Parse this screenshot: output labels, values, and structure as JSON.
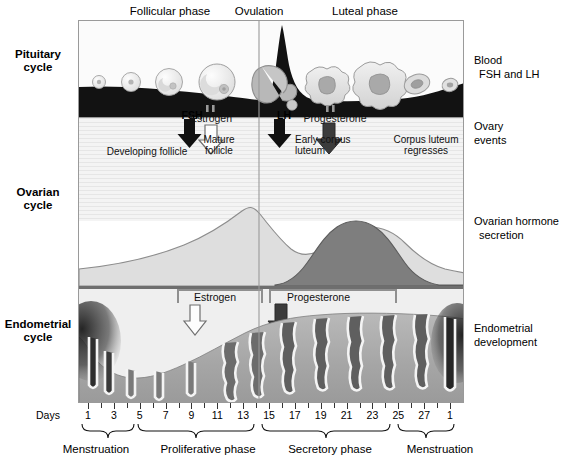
{
  "diagram": {
    "top_phases": [
      {
        "key": "follicular",
        "label": "Follicular phase"
      },
      {
        "key": "ovulation",
        "label": "Ovulation"
      },
      {
        "key": "luteal",
        "label": "Luteal phase"
      }
    ],
    "row_labels": [
      {
        "key": "pituitary",
        "line1": "Pituitary",
        "line2": "cycle"
      },
      {
        "key": "ovarian",
        "line1": "Ovarian",
        "line2": "cycle"
      },
      {
        "key": "endometrial",
        "line1": "Endometrial",
        "line2": "cycle"
      }
    ],
    "right_labels": [
      {
        "key": "blood",
        "line1": "Blood",
        "line2": "FSH and LH"
      },
      {
        "key": "ovary",
        "line1": "Ovary",
        "line2": "events"
      },
      {
        "key": "hormone",
        "line1": "Ovarian hormone",
        "line2": "secretion"
      },
      {
        "key": "endodev",
        "line1": "Endometrial",
        "line2": "development"
      }
    ],
    "pituitary_row": {
      "fsh_arrow_label": "FSH",
      "lh_arrow_label": "LH"
    },
    "ovary_row": {
      "developing_follicle": "Developing follicle",
      "mature_follicle_l1": "Mature",
      "mature_follicle_l2": "follicle",
      "early_corpus_luteum_l1": "Early corpus",
      "early_corpus_luteum_l2": "luteum",
      "corpus_luteum_regresses_l1": "Corpus luteum",
      "corpus_luteum_regresses_l2": "regresses",
      "estrogen_label": "Estrogen",
      "progesterone_label": "Progesterone"
    },
    "endometrium_row": {
      "estrogen_label": "Estrogen",
      "progesterone_label": "Progesterone"
    },
    "axis": {
      "days_word": "Days",
      "tick_labels": [
        "1",
        "3",
        "5",
        "7",
        "9",
        "11",
        "13",
        "15",
        "17",
        "19",
        "21",
        "23",
        "25",
        "27",
        "1"
      ],
      "bottom_phases": [
        {
          "key": "menstruation-1",
          "label": "Menstruation"
        },
        {
          "key": "proliferative",
          "label": "Proliferative phase"
        },
        {
          "key": "secretory",
          "label": "Secretory phase"
        },
        {
          "key": "menstruation-2",
          "label": "Menstruation"
        }
      ]
    },
    "colors": {
      "frame": "#9a9a9a",
      "fsh_lh_band": "#111111",
      "estrogen_curve": "#d8d8d8",
      "progesterone_curve": "#7b7b7b",
      "endometrium": "#a8a8a8",
      "arrow_dark": "#1a1a1a",
      "arrow_light": "#ffffff"
    }
  },
  "chart_data": {
    "type": "area",
    "xlabel": "Days",
    "ylabel": "",
    "x": [
      1,
      3,
      5,
      7,
      9,
      11,
      13,
      15,
      17,
      19,
      21,
      23,
      25,
      27,
      28
    ],
    "xlim": [
      1,
      28
    ],
    "grid": false,
    "legend": "none",
    "series": [
      {
        "name": "Blood FSH and LH",
        "panel": "pituitary",
        "values": [
          22,
          20,
          18,
          17,
          16,
          16,
          90,
          30,
          18,
          16,
          16,
          17,
          19,
          24,
          26
        ],
        "note": "LH/FSH surge spike at day 13-14 (ovulation)"
      },
      {
        "name": "Estrogen",
        "panel": "ovarian-hormone",
        "values": [
          10,
          12,
          15,
          20,
          28,
          42,
          72,
          52,
          40,
          45,
          52,
          50,
          38,
          18,
          10
        ],
        "note": "Peak just before ovulation, secondary luteal-phase rise"
      },
      {
        "name": "Progesterone",
        "panel": "ovarian-hormone",
        "values": [
          3,
          3,
          3,
          3,
          4,
          5,
          6,
          30,
          62,
          78,
          82,
          70,
          45,
          14,
          5
        ],
        "note": "Rises after ovulation, peaks around day 21-22"
      },
      {
        "name": "Endometrial thickness",
        "panel": "endometrium",
        "values": [
          62,
          22,
          14,
          20,
          28,
          38,
          48,
          62,
          72,
          80,
          84,
          86,
          84,
          78,
          64
        ],
        "note": "Shed during menstruation days 1-5, rebuilds, peaks in secretory phase"
      }
    ],
    "annotations": [
      {
        "text": "Ovulation",
        "x": 14,
        "type": "vertical-line"
      },
      {
        "text": "FSH",
        "x": 7,
        "type": "arrow-down"
      },
      {
        "text": "LH",
        "x": 14,
        "type": "arrow-down"
      },
      {
        "text": "Estrogen",
        "x": 9,
        "type": "arrow-down"
      },
      {
        "text": "Progesterone",
        "x": 19,
        "type": "arrow-down"
      }
    ]
  }
}
